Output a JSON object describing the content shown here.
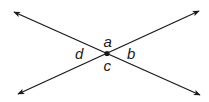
{
  "diagram": {
    "line_color": "#1a1a1a",
    "background": "#ffffff",
    "intersection": {
      "x": 107,
      "y": 54
    },
    "lines": [
      {
        "name": "line-1",
        "from": {
          "x": 14,
          "y": 12
        },
        "to": {
          "x": 200,
          "y": 95
        }
      },
      {
        "name": "line-2",
        "from": {
          "x": 18,
          "y": 94
        },
        "to": {
          "x": 199,
          "y": 11
        }
      }
    ],
    "labels": {
      "a": "a",
      "b": "b",
      "c": "c",
      "d": "d"
    }
  }
}
